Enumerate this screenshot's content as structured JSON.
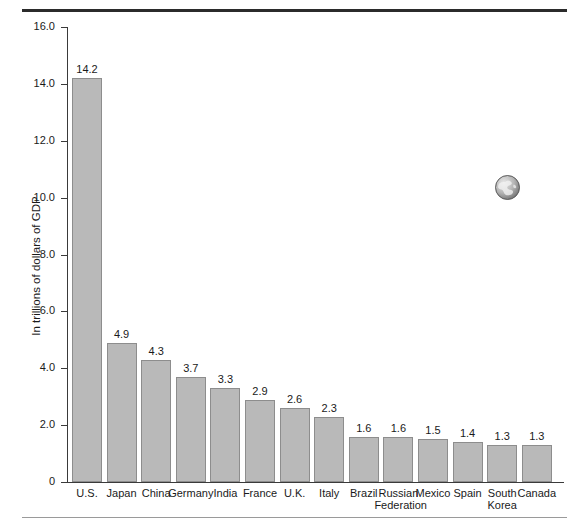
{
  "chart_data": {
    "type": "bar",
    "title": "",
    "subtitle": "",
    "xlabel": "",
    "ylabel": "In trillions of dollars of GDP",
    "ylim": [
      0,
      16.0
    ],
    "ytick_labels": [
      "16.0",
      "14.0",
      "12.0",
      "10.0",
      "8.0",
      "6.0",
      "4.0",
      "2.0",
      "0"
    ],
    "ytick_values": [
      16.0,
      14.0,
      12.0,
      10.0,
      8.0,
      6.0,
      4.0,
      2.0,
      0
    ],
    "grid": false,
    "legend": false,
    "bar_color": "#b9b9b9",
    "bar_border_color": "#8d8d8d",
    "axis_color": "#3a3a3a",
    "categories": [
      "U.S.",
      "Japan",
      "China",
      "Germany",
      "India",
      "France",
      "U.K.",
      "Italy",
      "Brazil",
      "Russian Federation",
      "Mexico",
      "Spain",
      "South Korea",
      "Canada"
    ],
    "values": [
      14.2,
      4.9,
      4.3,
      3.7,
      3.3,
      2.9,
      2.6,
      2.3,
      1.6,
      1.6,
      1.5,
      1.4,
      1.3,
      1.3
    ],
    "value_labels": [
      "14.2",
      "4.9",
      "4.3",
      "3.7",
      "3.3",
      "2.9",
      "2.6",
      "2.3",
      "1.6",
      "1.6",
      "1.5",
      "1.4",
      "1.3",
      "1.3"
    ]
  },
  "decorations": {
    "globe_icon_name": "globe-icon"
  }
}
